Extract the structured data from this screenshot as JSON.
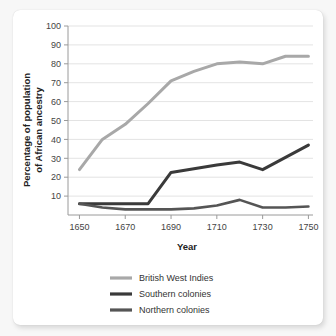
{
  "chart_data": {
    "type": "line",
    "title": "",
    "xlabel": "Year",
    "ylabel": "Percentage of population of African ancestry",
    "ylabel_line1": "Percentage of population",
    "ylabel_line2": "of African ancestry",
    "x": [
      1650,
      1660,
      1670,
      1680,
      1690,
      1700,
      1710,
      1720,
      1730,
      1740,
      1750
    ],
    "xlim": [
      1645,
      1752
    ],
    "ylim": [
      0,
      100
    ],
    "xticks": [
      1650,
      1670,
      1690,
      1710,
      1730,
      1750
    ],
    "yticks": [
      10,
      20,
      30,
      40,
      50,
      60,
      70,
      80,
      90,
      100
    ],
    "grid": true,
    "legend_position": "bottom",
    "series": [
      {
        "name": "British West Indies",
        "color": "#a8a8a8",
        "width": 3.0,
        "values": [
          24,
          40,
          48,
          59,
          71,
          76,
          80,
          81,
          80,
          84,
          84
        ]
      },
      {
        "name": "Southern colonies",
        "color": "#3a3a3a",
        "width": 3.0,
        "values": [
          6,
          6,
          6,
          6,
          22.5,
          24.5,
          26.5,
          28,
          24,
          30.5,
          37
        ]
      },
      {
        "name": "Northern colonies",
        "color": "#555555",
        "width": 2.6,
        "values": [
          6,
          4,
          3,
          3,
          3,
          3.5,
          5,
          8,
          4,
          4,
          4.5
        ]
      }
    ]
  },
  "legend": {
    "items": [
      {
        "label": "British West Indies",
        "color": "#a8a8a8"
      },
      {
        "label": "Southern colonies",
        "color": "#3a3a3a"
      },
      {
        "label": "Northern colonies",
        "color": "#555555"
      }
    ]
  }
}
